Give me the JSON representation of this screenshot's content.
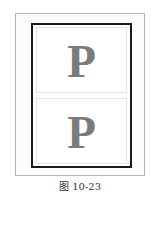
{
  "figure": {
    "panels": [
      {
        "letter": "P"
      },
      {
        "letter": "P"
      }
    ],
    "caption": "图 10-23",
    "colors": {
      "outer_border": "#b5b5b5",
      "inner_border": "#1a1a1a",
      "panel_border": "#e4e4e4",
      "glyph": "#7b7b7b"
    }
  }
}
